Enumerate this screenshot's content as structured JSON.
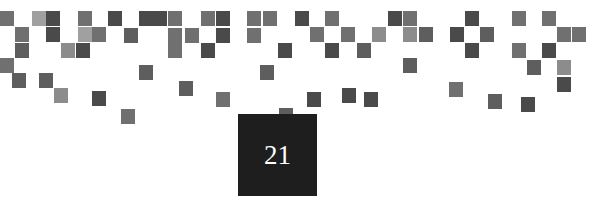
{
  "chapter_number": "21",
  "colors": {
    "background": "#ffffff",
    "number_box": "#1e1e1e",
    "number_text": "#ffffff"
  },
  "pixels": [
    {
      "x": 0,
      "y": 11,
      "c": "c3"
    },
    {
      "x": 32,
      "y": 11,
      "c": "c5"
    },
    {
      "x": 46,
      "y": 11,
      "c": "c1"
    },
    {
      "x": 78,
      "y": 11,
      "c": "c3"
    },
    {
      "x": 108,
      "y": 11,
      "c": "c1"
    },
    {
      "x": 139,
      "y": 11,
      "c": "c1"
    },
    {
      "x": 153,
      "y": 11,
      "c": "c1"
    },
    {
      "x": 168,
      "y": 11,
      "c": "c3"
    },
    {
      "x": 15,
      "y": 27,
      "c": "c3"
    },
    {
      "x": 46,
      "y": 27,
      "c": "c1"
    },
    {
      "x": 78,
      "y": 27,
      "c": "c5"
    },
    {
      "x": 92,
      "y": 27,
      "c": "c3"
    },
    {
      "x": 124,
      "y": 28,
      "c": "c2"
    },
    {
      "x": 168,
      "y": 28,
      "c": "c3"
    },
    {
      "x": 185,
      "y": 28,
      "c": "c3"
    },
    {
      "x": 15,
      "y": 43,
      "c": "c2"
    },
    {
      "x": 61,
      "y": 43,
      "c": "c4"
    },
    {
      "x": 76,
      "y": 43,
      "c": "c1"
    },
    {
      "x": 168,
      "y": 43,
      "c": "c3"
    },
    {
      "x": 0,
      "y": 58,
      "c": "c3"
    },
    {
      "x": 12,
      "y": 73,
      "c": "c2"
    },
    {
      "x": 39,
      "y": 73,
      "c": "c2"
    },
    {
      "x": 139,
      "y": 65,
      "c": "c2"
    },
    {
      "x": 54,
      "y": 88,
      "c": "c4"
    },
    {
      "x": 92,
      "y": 91,
      "c": "c1"
    },
    {
      "x": 179,
      "y": 81,
      "c": "c2"
    },
    {
      "x": 121,
      "y": 109,
      "c": "c3"
    },
    {
      "x": 201,
      "y": 11,
      "c": "c3"
    },
    {
      "x": 216,
      "y": 11,
      "c": "c1"
    },
    {
      "x": 247,
      "y": 11,
      "c": "c3"
    },
    {
      "x": 263,
      "y": 11,
      "c": "c3"
    },
    {
      "x": 295,
      "y": 11,
      "c": "c1"
    },
    {
      "x": 325,
      "y": 11,
      "c": "c3"
    },
    {
      "x": 388,
      "y": 11,
      "c": "c1"
    },
    {
      "x": 216,
      "y": 28,
      "c": "c1"
    },
    {
      "x": 247,
      "y": 28,
      "c": "c3"
    },
    {
      "x": 310,
      "y": 27,
      "c": "c3"
    },
    {
      "x": 341,
      "y": 27,
      "c": "c3"
    },
    {
      "x": 372,
      "y": 27,
      "c": "c4"
    },
    {
      "x": 201,
      "y": 43,
      "c": "c1"
    },
    {
      "x": 278,
      "y": 43,
      "c": "c1"
    },
    {
      "x": 325,
      "y": 43,
      "c": "c1"
    },
    {
      "x": 357,
      "y": 43,
      "c": "c2"
    },
    {
      "x": 260,
      "y": 65,
      "c": "c2"
    },
    {
      "x": 216,
      "y": 92,
      "c": "c3"
    },
    {
      "x": 307,
      "y": 92,
      "c": "c1"
    },
    {
      "x": 342,
      "y": 88,
      "c": "c1"
    },
    {
      "x": 364,
      "y": 92,
      "c": "c1"
    },
    {
      "x": 279,
      "y": 108,
      "c": "c2"
    },
    {
      "x": 403,
      "y": 11,
      "c": "c3"
    },
    {
      "x": 465,
      "y": 11,
      "c": "c1"
    },
    {
      "x": 512,
      "y": 11,
      "c": "c3"
    },
    {
      "x": 542,
      "y": 11,
      "c": "c3"
    },
    {
      "x": 403,
      "y": 27,
      "c": "c4"
    },
    {
      "x": 419,
      "y": 27,
      "c": "c2"
    },
    {
      "x": 450,
      "y": 27,
      "c": "c1"
    },
    {
      "x": 480,
      "y": 27,
      "c": "c2"
    },
    {
      "x": 557,
      "y": 27,
      "c": "c3"
    },
    {
      "x": 572,
      "y": 27,
      "c": "c3"
    },
    {
      "x": 465,
      "y": 43,
      "c": "c1"
    },
    {
      "x": 512,
      "y": 43,
      "c": "c3"
    },
    {
      "x": 542,
      "y": 43,
      "c": "c1"
    },
    {
      "x": 403,
      "y": 58,
      "c": "c2"
    },
    {
      "x": 527,
      "y": 60,
      "c": "c2"
    },
    {
      "x": 557,
      "y": 60,
      "c": "c4"
    },
    {
      "x": 557,
      "y": 77,
      "c": "c1"
    },
    {
      "x": 449,
      "y": 82,
      "c": "c3"
    },
    {
      "x": 488,
      "y": 94,
      "c": "c2"
    },
    {
      "x": 521,
      "y": 97,
      "c": "c1"
    }
  ]
}
